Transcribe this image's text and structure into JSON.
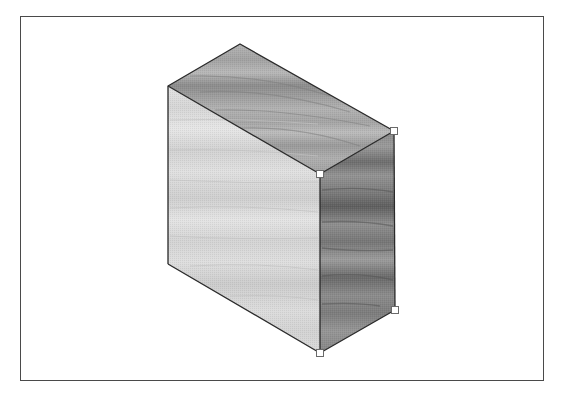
{
  "canvas": {
    "background": "#ffffff",
    "frame_border_color": "#4a4a4a"
  },
  "shape": {
    "type": "isometric-box",
    "texture": "wood-grain",
    "selected": true,
    "vertices": {
      "top_apex": [
        240,
        44
      ],
      "top_left": [
        168,
        86
      ],
      "top_right": [
        394,
        131
      ],
      "front_top_mid": [
        320,
        174
      ],
      "bottom_left": [
        168,
        264
      ],
      "bottom_mid": [
        320,
        353
      ],
      "bottom_right": [
        395,
        310
      ]
    },
    "faces": {
      "top": {
        "base_color": "#a9a9a9",
        "grain_color": "#7a7a7a"
      },
      "front": {
        "base_color": "#dcdcdc",
        "grain_color": "#bdbdbd"
      },
      "right": {
        "base_color": "#8e8e8e",
        "grain_color": "#5e5e5e"
      }
    },
    "edge_color": "#2a2a2a",
    "selection_handles": [
      {
        "name": "handle-top-right",
        "x": 394,
        "y": 131
      },
      {
        "name": "handle-front-top",
        "x": 320,
        "y": 174
      },
      {
        "name": "handle-bottom-right",
        "x": 395,
        "y": 310
      },
      {
        "name": "handle-bottom-mid",
        "x": 320,
        "y": 353
      }
    ],
    "handle_fill": "#ffffff",
    "handle_stroke": "#6a6a6a"
  }
}
